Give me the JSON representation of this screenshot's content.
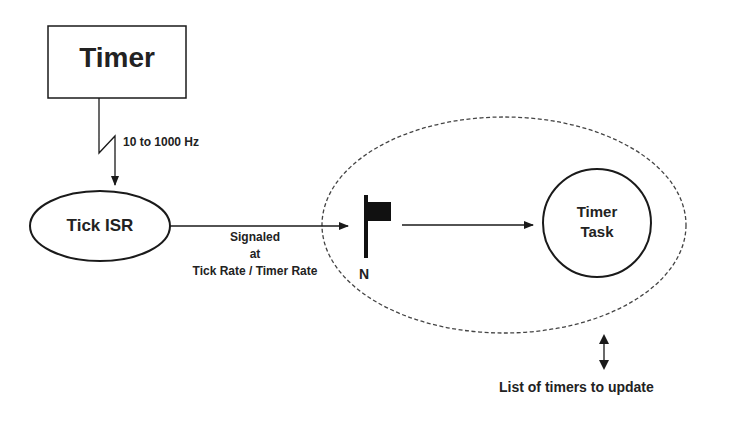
{
  "diagram": {
    "timer_box": {
      "label": "Timer"
    },
    "frequency_label": "10 to 1000 Hz",
    "tick_isr": {
      "label": "Tick ISR"
    },
    "signal_label": {
      "line1": "Signaled",
      "line2": "at",
      "line3": "Tick Rate / Timer Rate"
    },
    "flag": {
      "icon": "flag-icon",
      "label": "N"
    },
    "timer_task": {
      "line1": "Timer",
      "line2": "Task"
    },
    "list_label": "List of timers to update",
    "colors": {
      "stroke": "#1a1a1a",
      "dashed": "#444444",
      "background": "#ffffff"
    }
  }
}
